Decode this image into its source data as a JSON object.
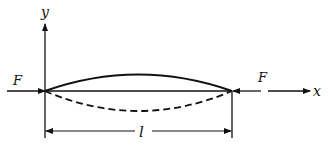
{
  "diagram": {
    "labels": {
      "y_axis": "y",
      "x_axis": "x",
      "force_left": "F",
      "force_right": "F",
      "length": "l"
    },
    "colors": {
      "stroke": "#111111",
      "background": "#ffffff"
    }
  }
}
